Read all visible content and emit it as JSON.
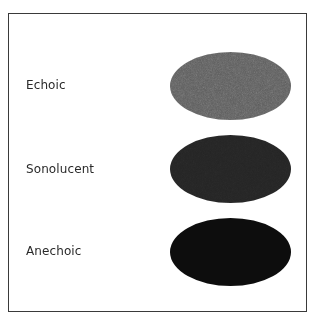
{
  "diagram": {
    "rows": [
      {
        "label": "Echoic",
        "fill": "#5b5b5b",
        "texture": "speckled-light"
      },
      {
        "label": "Sonolucent",
        "fill": "#262626",
        "texture": "speckled-dark"
      },
      {
        "label": "Anechoic",
        "fill": "#0d0d0d",
        "texture": "solid"
      }
    ],
    "frame_color": "#3a3a3a",
    "background": "#ffffff"
  }
}
